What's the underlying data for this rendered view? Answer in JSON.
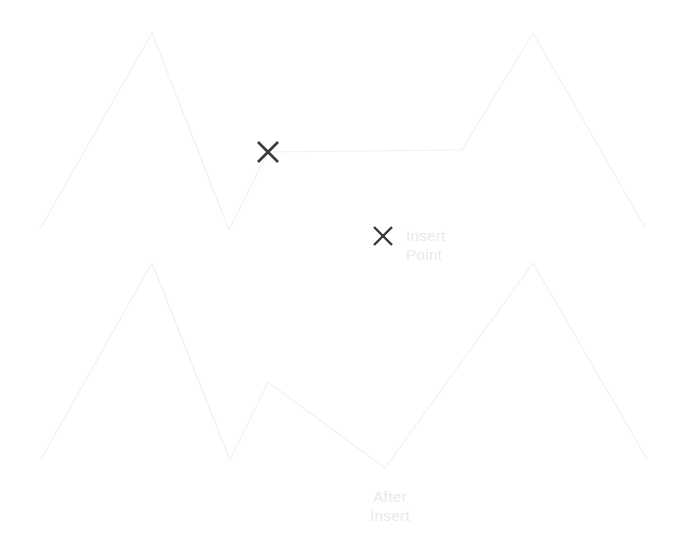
{
  "page": {
    "width": 679,
    "height": 558,
    "background": "#ffffff"
  },
  "colors": {
    "polyline_stroke": "#f0f0f0",
    "marker_stroke": "#3a3a3a",
    "label_text": "#e9e9e9"
  },
  "labels": {
    "insert_point": "Insert\nPoint",
    "after_insert": "After\nInsert"
  },
  "markers": {
    "on_curve": {
      "name": "insert-point-marker-x",
      "cx": 268,
      "cy": 152,
      "size": 20
    },
    "legend": {
      "name": "legend-marker-x",
      "cx": 383,
      "cy": 236,
      "size": 18
    }
  },
  "chart_data": {
    "type": "line",
    "title": "",
    "xlabel": "",
    "ylabel": "",
    "grid": false,
    "legend": "inline",
    "xlim": [
      0,
      679
    ],
    "ylim": [
      558,
      0
    ],
    "annotations": [
      {
        "text": "Insert Point",
        "x": 406,
        "y": 236
      },
      {
        "text": "After Insert",
        "x": 390,
        "y": 497
      }
    ],
    "series": [
      {
        "name": "Before Insert",
        "stroke": "#f0f0f0",
        "points": [
          [
            40,
            229
          ],
          [
            152,
            33
          ],
          [
            229,
            230
          ],
          [
            268,
            152
          ],
          [
            462,
            150
          ],
          [
            533,
            33
          ],
          [
            646,
            229
          ]
        ]
      },
      {
        "name": "After Insert",
        "stroke": "#f0f0f0",
        "points": [
          [
            41,
            459
          ],
          [
            152,
            263
          ],
          [
            230,
            460
          ],
          [
            268,
            382
          ],
          [
            385,
            468
          ],
          [
            533,
            263
          ],
          [
            647,
            459
          ]
        ]
      }
    ]
  }
}
